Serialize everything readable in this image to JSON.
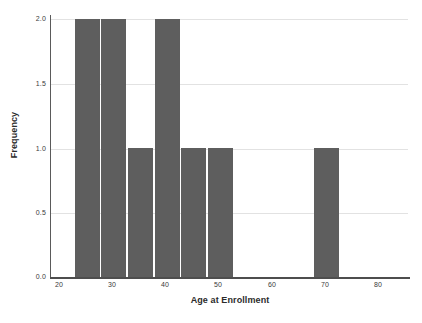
{
  "chart_data": {
    "type": "bar",
    "chart_subtype": "histogram",
    "title": "",
    "xlabel": "Age at Enrollment",
    "ylabel": "Frequency",
    "xlim": [
      18,
      86
    ],
    "ylim": [
      0,
      2.0
    ],
    "grid": true,
    "legend": false,
    "bin_width": 5,
    "bar_color": "#5e5e5e",
    "xticks": [
      20,
      30,
      40,
      50,
      60,
      70,
      80
    ],
    "xtick_labels": [
      "20",
      "30",
      "40",
      "50",
      "60",
      "70",
      "80"
    ],
    "yticks": [
      0.0,
      0.5,
      1.0,
      1.5,
      2.0
    ],
    "ytick_labels": [
      "0.0",
      "0.5",
      "1.0",
      "1.5",
      "2.0"
    ],
    "bins": [
      {
        "x0": 23,
        "x1": 28,
        "label": "23-28",
        "value": 2
      },
      {
        "x0": 28,
        "x1": 33,
        "label": "28-33",
        "value": 2
      },
      {
        "x0": 33,
        "x1": 38,
        "label": "33-38",
        "value": 1
      },
      {
        "x0": 38,
        "x1": 43,
        "label": "38-43",
        "value": 2
      },
      {
        "x0": 43,
        "x1": 48,
        "label": "43-48",
        "value": 1
      },
      {
        "x0": 48,
        "x1": 53,
        "label": "48-53",
        "value": 1
      },
      {
        "x0": 68,
        "x1": 73,
        "label": "68-73",
        "value": 1
      }
    ],
    "categories": [
      "23-28",
      "28-33",
      "33-38",
      "38-43",
      "43-48",
      "48-53",
      "68-73"
    ],
    "values": [
      2,
      2,
      1,
      2,
      1,
      1,
      1
    ]
  },
  "axes": {
    "x_title": "Age at Enrollment",
    "y_title": "Frequency"
  },
  "ytick_labels": {
    "t0": "0.0",
    "t1": "0.5",
    "t2": "1.0",
    "t3": "1.5",
    "t4": "2.0"
  },
  "xtick_labels": {
    "t0": "20",
    "t1": "30",
    "t2": "40",
    "t3": "50",
    "t4": "60",
    "t5": "70",
    "t6": "80"
  }
}
